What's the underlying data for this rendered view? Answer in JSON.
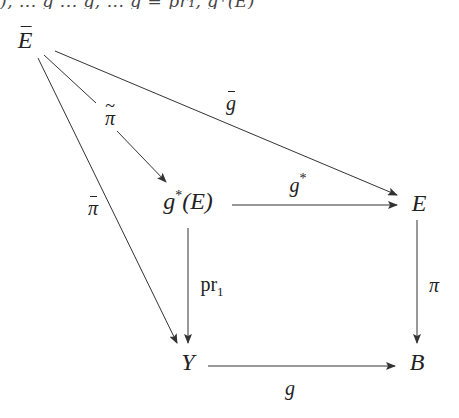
{
  "cutoff_text": "), ... g ... g, ... g = pr₁, g*(E)",
  "diagram": {
    "type": "commutative-diagram",
    "nodes": {
      "E_bar": {
        "text": "E",
        "accent": "bar",
        "x": 25,
        "y": 40
      },
      "g_star_E": {
        "text": "g",
        "sup": "*",
        "suffix": "(E)",
        "x": 188,
        "y": 203
      },
      "E": {
        "text": "E",
        "x": 419,
        "y": 203
      },
      "Y": {
        "text": "Y",
        "x": 188,
        "y": 362
      },
      "B": {
        "text": "B",
        "x": 417,
        "y": 362
      }
    },
    "arrows": [
      {
        "from": "E_bar",
        "to": "E",
        "label": "ḡ"
      },
      {
        "from": "E_bar",
        "to": "g_star_E",
        "label": "π̃"
      },
      {
        "from": "E_bar",
        "to": "Y",
        "label": "π̄"
      },
      {
        "from": "g_star_E",
        "to": "E",
        "label": "g*"
      },
      {
        "from": "g_star_E",
        "to": "Y",
        "label": "pr₁"
      },
      {
        "from": "E",
        "to": "B",
        "label": "π"
      },
      {
        "from": "Y",
        "to": "B",
        "label": "g"
      }
    ],
    "labels": {
      "g_bar": {
        "text": "g",
        "accent": "bar",
        "x": 231,
        "y": 103
      },
      "pi_tilde": {
        "text": "π",
        "accent": "tilde",
        "x": 110,
        "y": 118
      },
      "pi_bar": {
        "text": "π",
        "accent": "bar",
        "x": 93,
        "y": 208
      },
      "g_star": {
        "text": "g",
        "sup": "*",
        "x": 298,
        "y": 186
      },
      "pr1": {
        "text": "pr",
        "sub": "1",
        "x": 210,
        "y": 285
      },
      "pi": {
        "text": "π",
        "x": 434,
        "y": 285
      },
      "g": {
        "text": "g",
        "x": 290,
        "y": 388
      }
    },
    "stroke_color": "#333333",
    "text_color": "#222222"
  }
}
